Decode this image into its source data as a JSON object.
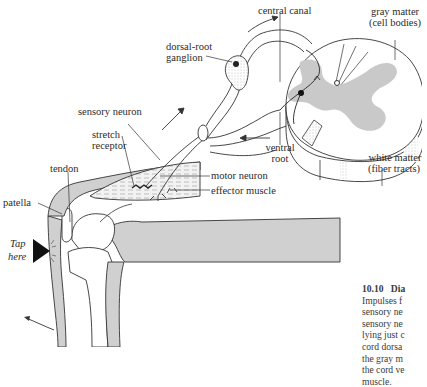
{
  "figure": {
    "labels": {
      "central_canal": "central canal",
      "gray_matter": "gray matter",
      "gray_matter_sub": "(cell bodies)",
      "dorsal_root_1": "dorsal-root",
      "dorsal_root_2": "ganglion",
      "sensory_neuron": "sensory neuron",
      "stretch_1": "stretch",
      "stretch_2": "receptor",
      "tendon": "tendon",
      "patella": "patella",
      "motor_neuron": "motor neuron",
      "effector_muscle": "effector muscle",
      "ventral_1": "ventral",
      "ventral_2": "root",
      "white_matter": "white matter",
      "white_matter_sub": "(fiber tracts)",
      "tap_1": "Tap",
      "tap_2": "here"
    },
    "caption": {
      "number": "10.10",
      "title": "Dia",
      "lines": [
        "Impulses f",
        "sensory ne",
        "sensory ne",
        "lying just c",
        "cord dorsa",
        "the gray m",
        "the cord ve",
        "muscle."
      ]
    },
    "colors": {
      "gray_fill": "#c9c9c9",
      "line": "#333333",
      "background": "#ffffff"
    }
  }
}
